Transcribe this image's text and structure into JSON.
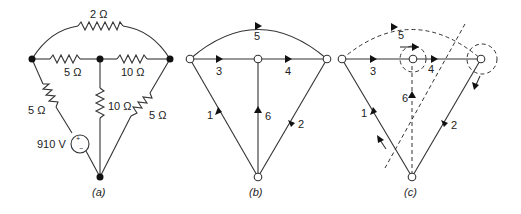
{
  "figure_a": {
    "caption": "(a)",
    "resistors": {
      "top": "2 Ω",
      "left_horizontal": "5 Ω",
      "right_horizontal": "10 Ω",
      "left_diagonal": "5 Ω",
      "center_vertical": "10 Ω",
      "right_diagonal": "5 Ω"
    },
    "source": {
      "label": "910 V",
      "plus": "+",
      "minus": "−"
    }
  },
  "figure_b": {
    "caption": "(b)",
    "branches": [
      "1",
      "2",
      "3",
      "4",
      "5",
      "6"
    ]
  },
  "figure_c": {
    "caption": "(c)",
    "branches": [
      "1",
      "2",
      "3",
      "4",
      "5",
      "6"
    ]
  }
}
